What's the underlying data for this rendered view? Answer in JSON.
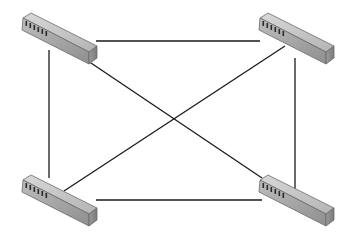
{
  "diagram": {
    "type": "network-topology",
    "topology": "full-mesh",
    "colors": {
      "background": "#ffffff",
      "link": "#1a1a1a",
      "switch_top": "#c8c8c8",
      "switch_front": "#a9a9a9",
      "switch_side": "#8a8a8a",
      "switch_outline": "#555555",
      "port": "#2a2a2a"
    },
    "nodes": [
      {
        "id": "switch-top-left",
        "icon": "network-switch-icon",
        "x": 19,
        "y": 12
      },
      {
        "id": "switch-top-right",
        "icon": "network-switch-icon",
        "x": 256,
        "y": 12
      },
      {
        "id": "switch-bottom-left",
        "icon": "network-switch-icon",
        "x": 19,
        "y": 174
      },
      {
        "id": "switch-bottom-right",
        "icon": "network-switch-icon",
        "x": 256,
        "y": 174
      }
    ],
    "links": [
      {
        "from": "switch-top-left",
        "to": "switch-top-right",
        "x1": 96,
        "y1": 41,
        "x2": 260,
        "y2": 41
      },
      {
        "from": "switch-bottom-left",
        "to": "switch-bottom-right",
        "x1": 96,
        "y1": 200,
        "x2": 262,
        "y2": 200
      },
      {
        "from": "switch-top-left",
        "to": "switch-bottom-left",
        "x1": 49,
        "y1": 50,
        "x2": 49,
        "y2": 178
      },
      {
        "from": "switch-top-right",
        "to": "switch-bottom-right",
        "x1": 295,
        "y1": 58,
        "x2": 295,
        "y2": 189
      },
      {
        "from": "switch-top-left",
        "to": "switch-bottom-right",
        "x1": 88,
        "y1": 61,
        "x2": 262,
        "y2": 178
      },
      {
        "from": "switch-top-right",
        "to": "switch-bottom-left",
        "x1": 285,
        "y1": 46,
        "x2": 64,
        "y2": 191
      }
    ]
  }
}
